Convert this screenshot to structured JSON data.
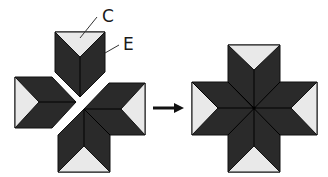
{
  "labels": {
    "c": "C",
    "e": "E"
  },
  "colors": {
    "dark": "#2a2a2a",
    "light": "#e9e9e9",
    "line": "#111111",
    "background": "#ffffff"
  },
  "figures": [
    {
      "name": "separated-pieces",
      "description": "Three separated diamond-star pieces: top arm, left arm, and an L-shaped bottom/right pair"
    },
    {
      "name": "assembled-star",
      "description": "Eight-point star assembled into a cross-shaped block"
    }
  ],
  "arrow": {
    "direction": "right"
  }
}
